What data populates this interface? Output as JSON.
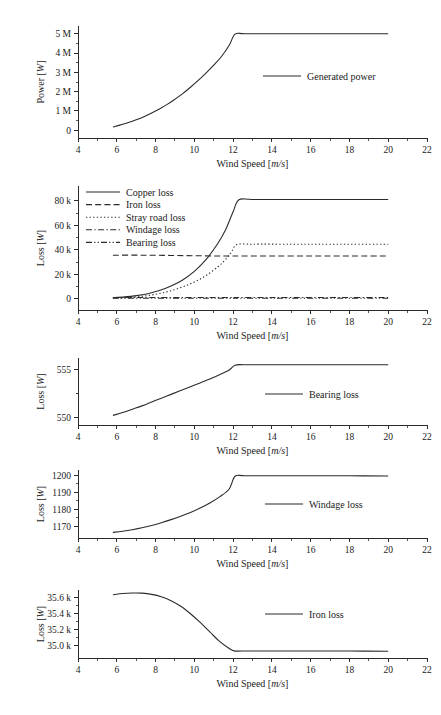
{
  "figure": {
    "background": "#ffffff",
    "line_color": "#2b2b2b",
    "width": 441,
    "height": 715
  },
  "common": {
    "xlabel_text": "Wind Speed [",
    "xlabel_unit": "m/s",
    "xlabel_close": "]",
    "ylabel_power_text": "Power [",
    "ylabel_loss_text": "Loss [",
    "ylabel_unit": "W",
    "ylabel_close": "]",
    "x_ticks": [
      "4",
      "6",
      "8",
      "10",
      "12",
      "14",
      "16",
      "18",
      "20",
      "22"
    ],
    "x_tick_values": [
      4,
      6,
      8,
      10,
      12,
      14,
      16,
      18,
      20,
      22
    ],
    "xlim": [
      4,
      22
    ]
  },
  "chart_data": [
    {
      "id": "generated-power",
      "type": "line",
      "title": "",
      "xlabel": "Wind Speed [m/s]",
      "ylabel": "Power [W]",
      "xlim": [
        4,
        22
      ],
      "ylim": [
        -400000,
        5400000
      ],
      "grid": false,
      "y_ticks": [
        0,
        1000000,
        2000000,
        3000000,
        4000000,
        5000000
      ],
      "y_ticklabels": [
        "0",
        "1 M",
        "2 M",
        "3 M",
        "4 M",
        "5 M"
      ],
      "legend_position": "center-right",
      "series": [
        {
          "name": "Generated power",
          "style": "solid",
          "x": [
            5.8,
            6.2,
            6.6,
            7.0,
            7.4,
            7.8,
            8.2,
            8.6,
            9.0,
            9.4,
            9.8,
            10.2,
            10.6,
            11.0,
            11.4,
            11.8,
            12.1,
            12.6,
            14.0,
            16.0,
            18.0,
            20.0
          ],
          "y": [
            170000,
            280000,
            400000,
            540000,
            700000,
            890000,
            1100000,
            1340000,
            1610000,
            1900000,
            2230000,
            2580000,
            2960000,
            3370000,
            3820000,
            4400000,
            4980000,
            5000000,
            5000000,
            5000000,
            5000000,
            5000000
          ]
        }
      ]
    },
    {
      "id": "all-losses",
      "type": "line",
      "title": "",
      "xlabel": "Wind Speed [m/s]",
      "ylabel": "Loss [W]",
      "xlim": [
        4,
        22
      ],
      "ylim": [
        -9000,
        92000
      ],
      "grid": false,
      "y_ticks": [
        0,
        20000,
        40000,
        60000,
        80000
      ],
      "y_ticklabels": [
        "0",
        "20 k",
        "40 k",
        "60 k",
        "80 k"
      ],
      "legend_position": "top-left",
      "series": [
        {
          "name": "Copper loss",
          "style": "solid",
          "x": [
            5.8,
            6.4,
            7.0,
            7.6,
            8.2,
            8.8,
            9.4,
            10.0,
            10.6,
            11.2,
            11.6,
            12.0,
            12.3,
            13.0,
            15.0,
            17.0,
            20.0
          ],
          "y": [
            1100,
            1700,
            2700,
            4300,
            6800,
            10500,
            15500,
            22500,
            32000,
            45000,
            56000,
            71000,
            80800,
            81000,
            81000,
            81000,
            81000
          ]
        },
        {
          "name": "Iron loss",
          "style": "dashed",
          "x": [
            5.8,
            7.0,
            8.0,
            9.0,
            10.0,
            11.0,
            11.6,
            12.0,
            12.4,
            14.0,
            16.0,
            18.0,
            20.0
          ],
          "y": [
            35640,
            35660,
            35560,
            35400,
            35200,
            35020,
            34960,
            34930,
            34930,
            34930,
            34930,
            34930,
            34930
          ]
        },
        {
          "name": "Stray road loss",
          "style": "dotted",
          "x": [
            5.8,
            6.4,
            7.0,
            7.6,
            8.2,
            8.8,
            9.4,
            10.0,
            10.6,
            11.2,
            11.6,
            11.9,
            12.2,
            13.0,
            15.0,
            17.0,
            20.0
          ],
          "y": [
            600,
            1000,
            1700,
            2800,
            4400,
            6700,
            9800,
            13800,
            19000,
            26000,
            32000,
            38000,
            44300,
            44600,
            44600,
            44600,
            44600
          ]
        },
        {
          "name": "Windage loss",
          "style": "dashdot",
          "x": [
            5.8,
            7.0,
            8.0,
            9.0,
            10.0,
            11.0,
            12.0,
            12.2,
            14.0,
            16.0,
            18.0,
            20.0
          ],
          "y": [
            1166,
            1172,
            1178,
            1185,
            1191,
            1196,
            1199,
            1200,
            1200,
            1200,
            1200,
            1200
          ]
        },
        {
          "name": "Bearing loss",
          "style": "dashdotdot",
          "x": [
            5.8,
            7.0,
            8.0,
            9.0,
            10.0,
            11.0,
            12.0,
            12.2,
            14.0,
            16.0,
            18.0,
            20.0
          ],
          "y": [
            550.2,
            551.3,
            552.3,
            553.3,
            554.2,
            555.0,
            555.4,
            555.5,
            555.5,
            555.5,
            555.5,
            555.5
          ]
        }
      ]
    },
    {
      "id": "bearing-loss",
      "type": "line",
      "title": "",
      "xlabel": "Wind Speed [m/s]",
      "ylabel": "Loss [W]",
      "xlim": [
        4,
        22
      ],
      "ylim": [
        549.2,
        556.2
      ],
      "grid": false,
      "y_ticks": [
        550,
        555
      ],
      "y_ticklabels": [
        "550",
        "555"
      ],
      "y_minor_ticks": [
        552.5
      ],
      "legend_position": "center-right",
      "series": [
        {
          "name": "Bearing loss",
          "style": "solid",
          "x": [
            5.8,
            6.3,
            6.8,
            7.3,
            7.8,
            8.3,
            8.8,
            9.3,
            9.8,
            10.3,
            10.8,
            11.3,
            11.8,
            12.1,
            12.6,
            14.0,
            16.0,
            18.0,
            20.0
          ],
          "y": [
            550.2,
            550.5,
            550.85,
            551.2,
            551.6,
            552.0,
            552.4,
            552.8,
            553.2,
            553.6,
            554.0,
            554.45,
            554.95,
            555.45,
            555.5,
            555.5,
            555.5,
            555.5,
            555.5
          ]
        }
      ]
    },
    {
      "id": "windage-loss",
      "type": "line",
      "title": "",
      "xlabel": "Wind Speed [m/s]",
      "ylabel": "Loss [W]",
      "xlim": [
        4,
        22
      ],
      "ylim": [
        1163,
        1203
      ],
      "grid": false,
      "y_ticks": [
        1170,
        1180,
        1190,
        1200
      ],
      "y_ticklabels": [
        "1170",
        "1180",
        "1190",
        "1200"
      ],
      "legend_position": "center-right",
      "series": [
        {
          "name": "Windage loss",
          "style": "solid",
          "x": [
            5.8,
            6.3,
            6.8,
            7.3,
            7.8,
            8.3,
            8.8,
            9.3,
            9.8,
            10.3,
            10.8,
            11.3,
            11.8,
            12.1,
            12.6,
            14.0,
            16.0,
            18.0,
            20.0
          ],
          "y": [
            1166.3,
            1167.0,
            1167.9,
            1169.0,
            1170.4,
            1172.0,
            1173.8,
            1175.8,
            1178.0,
            1180.6,
            1183.6,
            1187.2,
            1191.8,
            1199.3,
            1199.6,
            1199.6,
            1199.6,
            1199.6,
            1199.5
          ]
        }
      ]
    },
    {
      "id": "iron-loss",
      "type": "line",
      "title": "",
      "xlabel": "Wind Speed [m/s]",
      "ylabel": "Loss [W]",
      "xlim": [
        4,
        22
      ],
      "ylim": [
        34840,
        35700
      ],
      "grid": false,
      "y_ticks": [
        35000,
        35200,
        35400,
        35600
      ],
      "y_ticklabels": [
        "35.0 k",
        "35.2 k",
        "35.4 k",
        "35.6 k"
      ],
      "legend_position": "center-right",
      "series": [
        {
          "name": "Iron loss",
          "style": "solid",
          "x": [
            5.8,
            6.3,
            6.8,
            7.3,
            7.8,
            8.3,
            8.8,
            9.3,
            9.8,
            10.3,
            10.8,
            11.3,
            11.8,
            12.05,
            12.5,
            14.0,
            16.0,
            18.0,
            20.0
          ],
          "y": [
            35640,
            35655,
            35662,
            35660,
            35645,
            35615,
            35565,
            35495,
            35400,
            35290,
            35170,
            35050,
            34960,
            34930,
            34928,
            34928,
            34928,
            34928,
            34925
          ]
        }
      ]
    }
  ],
  "panels": [
    {
      "name": "panel-generated-power",
      "chart_index": 0,
      "plot_left": 78,
      "plot_right": 427,
      "plot_top": 26,
      "plot_bottom": 138,
      "legend": {
        "x": 263,
        "y": 76,
        "line_len": 38
      }
    },
    {
      "name": "panel-all-losses",
      "chart_index": 1,
      "plot_left": 78,
      "plot_right": 427,
      "plot_top": 186,
      "plot_bottom": 310,
      "legend": {
        "x": 86,
        "y": 192,
        "line_len": 34,
        "row_gap": 12.6
      }
    },
    {
      "name": "panel-bearing-loss",
      "chart_index": 2,
      "plot_left": 78,
      "plot_right": 427,
      "plot_top": 358,
      "plot_bottom": 425,
      "legend": {
        "x": 265,
        "y": 394,
        "line_len": 38
      }
    },
    {
      "name": "panel-windage-loss",
      "chart_index": 3,
      "plot_left": 78,
      "plot_right": 427,
      "plot_top": 470,
      "plot_bottom": 538,
      "legend": {
        "x": 265,
        "y": 504,
        "line_len": 38
      }
    },
    {
      "name": "panel-iron-loss",
      "chart_index": 4,
      "plot_left": 78,
      "plot_right": 427,
      "plot_top": 590,
      "plot_bottom": 658,
      "legend": {
        "x": 265,
        "y": 614,
        "line_len": 38
      }
    }
  ]
}
